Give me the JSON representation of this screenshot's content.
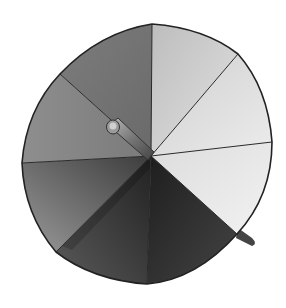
{
  "image": {
    "subject": "spinner",
    "description": "Grayscale spinner disc divided into 8 sectors with a pointer at the center",
    "sector_count": 8,
    "center": [
      151,
      156
    ],
    "spoke_endpoints": [
      [
        152,
        24
      ],
      [
        238,
        54
      ],
      [
        272,
        142
      ],
      [
        237,
        234
      ],
      [
        147,
        284
      ],
      [
        56,
        252
      ],
      [
        22,
        163
      ],
      [
        60,
        74
      ]
    ],
    "sector_colors": [
      "#c9c9c9",
      "#d6d6d6",
      "#e6e6e6",
      "#333333",
      "#3e3e3e",
      "#6e6e6e",
      "#8a8a8a",
      "#6f6f6f"
    ],
    "outline_color": "#222222",
    "background": "#ffffff"
  }
}
